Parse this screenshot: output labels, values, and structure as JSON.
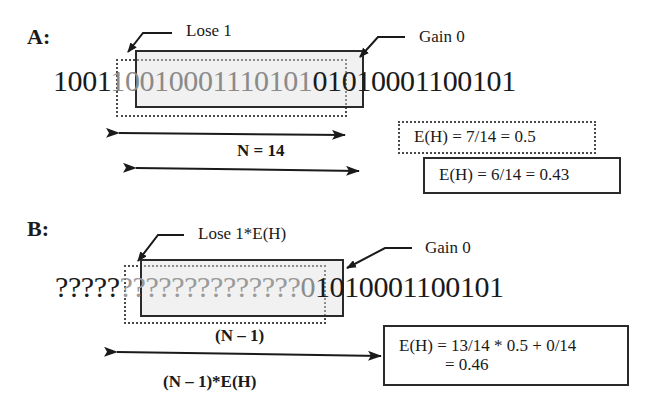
{
  "panel_a": {
    "label": "A:",
    "lose_callout": "Lose 1",
    "gain_callout": "Gain 0",
    "bits_prefix": "1001",
    "bits_window": "10010001110101",
    "bits_suffix": "01010001100101",
    "window_length_label": "N = 14",
    "estimate_old": "E(H) = 7/14 = 0.5",
    "estimate_new": "E(H) = 6/14 = 0.43"
  },
  "panel_b": {
    "label": "B:",
    "lose_callout": "Lose 1*E(H)",
    "gain_callout": "Gain 0",
    "unknown_prefix": "?????",
    "unknown_window": "??????????????",
    "window_last": "0",
    "bits_suffix": "1010001100101",
    "window_length_label": "(N – 1)",
    "weighted_label": "(N – 1)*E(H)",
    "estimate_line1": "E(H) = 13/14 * 0.5 + 0/14",
    "estimate_line2": "= 0.46"
  },
  "colors": {
    "ink": "#1a1a1a",
    "window_text": "#8a8a8a",
    "window_fill": "#e1e1e1",
    "box_border": "#2a2a2a"
  }
}
